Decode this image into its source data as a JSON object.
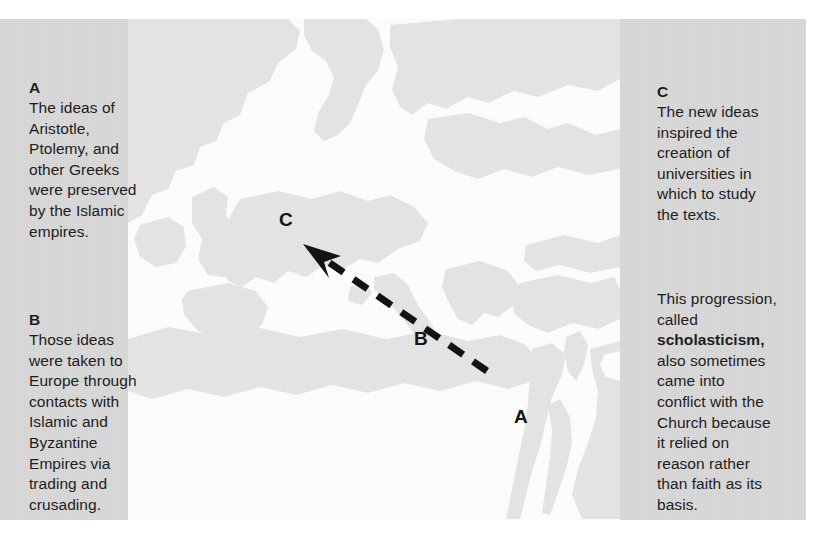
{
  "figure": {
    "colors": {
      "panel_background": "#d9d9d9",
      "sea": "#ffffff",
      "land": "#e6e6e6",
      "text": "#1b1b1b",
      "arrow": "#111111"
    }
  },
  "left_column": {
    "blocks": [
      {
        "label": "A",
        "body": "The ideas of\nAristotle,\nPtolemy, and\nother Greeks\nwere preserved\nby the Islamic\nempires."
      },
      {
        "label": "B",
        "body": "Those ideas\nwere taken to\nEurope through\ncontacts with\nIslamic and\nByzantine\nEmpires via\ntrading and\ncrusading."
      }
    ]
  },
  "right_column": {
    "blocks": [
      {
        "label": "C",
        "body": "The new ideas\ninspired the\ncreation of\nuniversities in\nwhich to study\nthe texts."
      },
      {
        "label": "",
        "body_pre": "This progression,\ncalled\n",
        "body_bold": "scholasticism,",
        "body_post": "\nalso sometimes\ncame into\nconflict with the\nChurch because\nit relied on\nreason rather\nthan faith as its\nbasis."
      }
    ]
  },
  "map": {
    "labels": [
      {
        "id": "a",
        "text": "A",
        "x": 514,
        "y": 388
      },
      {
        "id": "b",
        "text": "B",
        "x": 414,
        "y": 310
      },
      {
        "id": "c",
        "text": "C",
        "x": 279,
        "y": 191
      }
    ],
    "arrow": {
      "style": "dashed",
      "direction": "northwest",
      "from": {
        "x": 487,
        "y": 352
      },
      "to": {
        "x": 307,
        "y": 228
      }
    },
    "region": "Europe, North Africa, and the Near East"
  }
}
